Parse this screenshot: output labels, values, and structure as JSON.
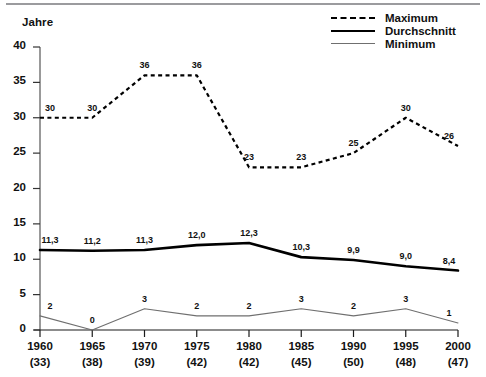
{
  "chart_data": {
    "type": "line",
    "title": "",
    "ylabel": "Jahre",
    "xlabel": "",
    "ylim": [
      0,
      40
    ],
    "yticks": [
      0,
      5,
      10,
      15,
      20,
      25,
      30,
      35,
      40
    ],
    "grid": false,
    "legend_position": "top-right",
    "categories": [
      "1960",
      "1965",
      "1970",
      "1975",
      "1980",
      "1985",
      "1990",
      "1995",
      "2000"
    ],
    "category_sublabels": [
      "(33)",
      "(38)",
      "(39)",
      "(42)",
      "(42)",
      "(45)",
      "(50)",
      "(48)",
      "(47)"
    ],
    "series": [
      {
        "name": "Maximum",
        "style": "dashed",
        "color": "#000000",
        "values": [
          30,
          30,
          36,
          36,
          23,
          23,
          25,
          30,
          26
        ],
        "labels": [
          "30",
          "30",
          "36",
          "36",
          "23",
          "23",
          "25",
          "30",
          "26"
        ]
      },
      {
        "name": "Durchschnitt",
        "style": "solid-thick",
        "color": "#000000",
        "values": [
          11.3,
          11.2,
          11.3,
          12.0,
          12.3,
          10.3,
          9.9,
          9.0,
          8.4
        ],
        "labels": [
          "11,3",
          "11,2",
          "11,3",
          "12,0",
          "12,3",
          "10,3",
          "9,9",
          "9,0",
          "8,4"
        ]
      },
      {
        "name": "Minimum",
        "style": "solid-thin",
        "color": "#6f6f6f",
        "values": [
          2,
          0,
          3,
          2,
          2,
          3,
          2,
          3,
          1
        ],
        "labels": [
          "2",
          "0",
          "3",
          "2",
          "2",
          "3",
          "2",
          "3",
          "1"
        ]
      }
    ]
  },
  "legend": {
    "items": [
      {
        "label": "Maximum",
        "icon": "dashed-line-icon"
      },
      {
        "label": "Durchschnitt",
        "icon": "thick-line-icon"
      },
      {
        "label": "Minimum",
        "icon": "thin-line-icon"
      }
    ]
  },
  "colors": {
    "maximum": "#000000",
    "durchschnitt": "#000000",
    "minimum": "#6f6f6f",
    "axis": "#555555",
    "top_rule": "#9b9b9e"
  }
}
